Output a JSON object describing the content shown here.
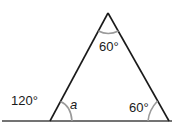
{
  "diagram": {
    "type": "triangle-angles",
    "labels": {
      "apex_angle": "60°",
      "exterior_angle": "120°",
      "interior_left": "a",
      "interior_right": "60°"
    },
    "colors": {
      "line": "#1a1a1a",
      "arc": "#9a9a9a",
      "text": "#1a1a1a"
    }
  }
}
